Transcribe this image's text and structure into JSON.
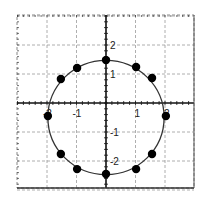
{
  "chart_data": {
    "type": "scatter",
    "title": "",
    "xlabel": "",
    "ylabel": "",
    "xlim": [
      -3,
      3
    ],
    "ylim": [
      -3,
      3
    ],
    "grid": true,
    "x_ticks": [
      -2,
      -1,
      1,
      2
    ],
    "y_ticks": [
      2,
      1,
      -1,
      -2
    ],
    "x_tick_labels": [
      "-2",
      "-1",
      "1",
      "2"
    ],
    "y_tick_labels": [
      "2",
      "1",
      "-1",
      "-2"
    ],
    "curve": {
      "shape": "circle",
      "center": [
        0,
        -0.5
      ],
      "radius": 1.97
    },
    "series": [
      {
        "name": "points",
        "x": [
          0,
          1.02,
          1.56,
          2.03,
          1.56,
          1.02,
          0,
          -0.98,
          -1.53,
          -1.97,
          -1.53,
          -0.98
        ],
        "y": [
          1.48,
          1.24,
          0.86,
          -0.45,
          -1.76,
          -2.28,
          -2.45,
          -2.28,
          -1.76,
          -0.45,
          0.83,
          1.21
        ]
      }
    ]
  },
  "colors": {
    "axis": "#111111",
    "grid": "#9a9a9a",
    "curve": "#333333",
    "point": "#000000",
    "frame": "#333333"
  }
}
